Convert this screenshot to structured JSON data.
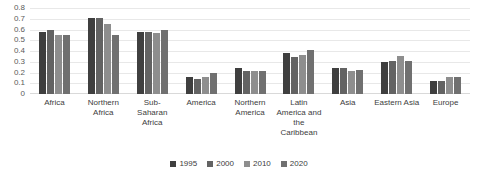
{
  "chart_data": {
    "type": "bar",
    "title": "",
    "subtitle": "",
    "xlabel": "",
    "ylabel": "",
    "ylim": [
      0,
      0.8
    ],
    "ytick_labels": [
      "0.8",
      "0.7",
      "0.6",
      "0.5",
      "0.4",
      "0.3",
      "0.2",
      "0.1",
      "0"
    ],
    "ytick_values": [
      0.8,
      0.7,
      0.6,
      0.5,
      0.4,
      0.3,
      0.2,
      0.1,
      0
    ],
    "grid": true,
    "legend_position": "bottom",
    "categories": [
      "Africa",
      "Northern Africa",
      "Sub-Saharan Africa",
      "America",
      "Northern America",
      "Latin America and the Caribbean",
      "Asia",
      "Eastern Asia",
      "Europe"
    ],
    "series": [
      {
        "name": "1995",
        "color": "#3f3f3f",
        "values": [
          0.58,
          0.71,
          0.58,
          0.16,
          0.24,
          0.38,
          0.24,
          0.3,
          0.12
        ]
      },
      {
        "name": "2000",
        "color": "#636363",
        "values": [
          0.6,
          0.71,
          0.58,
          0.14,
          0.21,
          0.34,
          0.24,
          0.31,
          0.12
        ]
      },
      {
        "name": "2010",
        "color": "#8e8e8e",
        "values": [
          0.55,
          0.65,
          0.57,
          0.16,
          0.21,
          0.36,
          0.21,
          0.35,
          0.16
        ]
      },
      {
        "name": "2020",
        "color": "#707070",
        "values": [
          0.55,
          0.55,
          0.6,
          0.2,
          0.21,
          0.41,
          0.22,
          0.31,
          0.16
        ]
      }
    ]
  },
  "legend": {
    "items": [
      {
        "label": "1995"
      },
      {
        "label": "2000"
      },
      {
        "label": "2010"
      },
      {
        "label": "2020"
      }
    ]
  }
}
